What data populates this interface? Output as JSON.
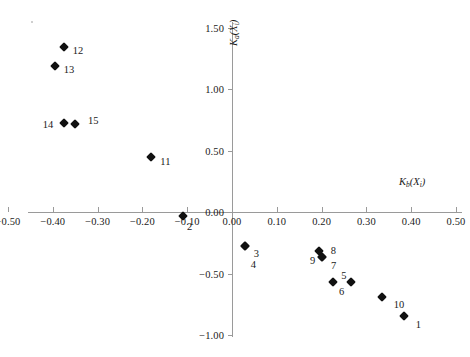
{
  "chart_data": {
    "type": "scatter",
    "title": "",
    "xlabel": "Kb(Xi)",
    "ylabel": "Ka(Xi)",
    "xlabel_parts": {
      "base": "K",
      "sub1": "b",
      "mid": "(X",
      "sub2": "i",
      "end": ")"
    },
    "ylabel_parts": {
      "base": "K",
      "sub1": "a",
      "mid": "(X",
      "sub2": "i",
      "end": ")"
    },
    "xlim": [
      -0.5,
      0.5
    ],
    "ylim": [
      -1.0,
      1.5
    ],
    "xticks": [
      "-0.50",
      "-0.40",
      "-0.30",
      "-0.20",
      "-0.10",
      "0.00",
      "0.10",
      "0.20",
      "0.30",
      "0.40",
      "0.50"
    ],
    "xtick_values": [
      -0.5,
      -0.4,
      -0.3,
      -0.2,
      -0.1,
      0.0,
      0.1,
      0.2,
      0.3,
      0.4,
      0.5
    ],
    "yticks": [
      "1.50",
      "1.00",
      "0.50",
      "0.00",
      "-0.50",
      "-1.00"
    ],
    "ytick_values": [
      1.5,
      1.0,
      0.5,
      0.0,
      -0.5,
      -1.0
    ],
    "grid": false,
    "legend": false,
    "marker": "diamond",
    "marker_color": "#111111",
    "axis_color": "#9a9a9a",
    "points": [
      {
        "label": "1",
        "x": 0.385,
        "y": -0.845,
        "label_dx": 14,
        "label_dy": 8
      },
      {
        "label": "2",
        "x": -0.11,
        "y": -0.035,
        "label_dx": 7,
        "label_dy": 10
      },
      {
        "label": "3",
        "x": 0.03,
        "y": -0.275,
        "label_dx": 11,
        "label_dy": 7
      },
      {
        "label": "4",
        "x": 0.03,
        "y": -0.275,
        "label_dx": 8,
        "label_dy": 18
      },
      {
        "label": "5",
        "x": 0.225,
        "y": -0.57,
        "label_dx": 11,
        "label_dy": -7
      },
      {
        "label": "6",
        "x": 0.265,
        "y": -0.57,
        "label_dx": -9,
        "label_dy": 9
      },
      {
        "label": "7",
        "x": 0.2,
        "y": -0.365,
        "label_dx": 12,
        "label_dy": 8
      },
      {
        "label": "8",
        "x": 0.195,
        "y": -0.32,
        "label_dx": 14,
        "label_dy": -1
      },
      {
        "label": "9",
        "x": 0.2,
        "y": -0.365,
        "label_dx": -9,
        "label_dy": 3
      },
      {
        "label": "10",
        "x": 0.335,
        "y": -0.69,
        "label_dx": 17,
        "label_dy": 7
      },
      {
        "label": "11",
        "x": -0.18,
        "y": 0.445,
        "label_dx": 14,
        "label_dy": 4
      },
      {
        "label": "12",
        "x": -0.375,
        "y": 1.345,
        "label_dx": 14,
        "label_dy": 3
      },
      {
        "label": "13",
        "x": -0.395,
        "y": 1.19,
        "label_dx": 14,
        "label_dy": 3
      },
      {
        "label": "14",
        "x": -0.375,
        "y": 0.725,
        "label_dx": -16,
        "label_dy": 1
      },
      {
        "label": "15",
        "x": -0.35,
        "y": 0.715,
        "label_dx": 18,
        "label_dy": -4
      }
    ]
  }
}
